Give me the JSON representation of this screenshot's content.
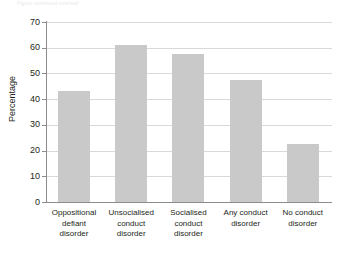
{
  "caption_fragment": "Figure continued overleaf",
  "chart_data": {
    "type": "bar",
    "title": "",
    "xlabel": "",
    "ylabel": "Percentage",
    "ylim": [
      0,
      70
    ],
    "ytick_step": 10,
    "yticks": [
      0,
      10,
      20,
      30,
      40,
      50,
      60,
      70
    ],
    "ytick_labels": [
      "0",
      "10",
      "20",
      "30",
      "40",
      "50",
      "60",
      "70"
    ],
    "grid": true,
    "legend": "none",
    "bar_color": "#c9c9c9",
    "axis_color": "#8c8c8c",
    "grid_color": "#d9d9d9",
    "categories": [
      "Oppositional defiant disorder",
      "Unsocialised conduct disorder",
      "Socialised conduct disorder",
      "Any conduct disorder",
      "No conduct disorder"
    ],
    "category_lines": [
      [
        "Oppositional",
        "defiant",
        "disorder"
      ],
      [
        "Unsocialised",
        "conduct",
        "disorder"
      ],
      [
        "Socialised",
        "conduct",
        "disorder"
      ],
      [
        "Any conduct",
        "disorder"
      ],
      [
        "No conduct",
        "disorder"
      ]
    ],
    "values": [
      43,
      61,
      57.5,
      47.5,
      22.5
    ]
  }
}
